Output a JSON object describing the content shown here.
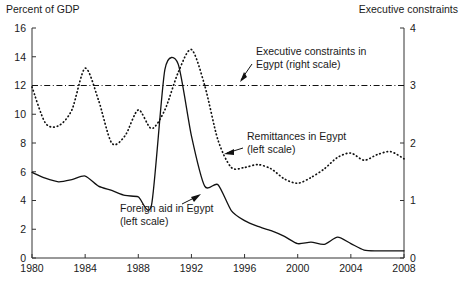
{
  "chart_data": {
    "type": "line",
    "title": "",
    "xlabel": "",
    "ylabel": "Percent of GDP",
    "y2label": "Executive constraints",
    "xlim": [
      1980,
      2008
    ],
    "ylim": [
      0,
      16
    ],
    "y2lim": [
      0,
      4
    ],
    "grid": false,
    "legend_position": "inline-annotations",
    "xticks": [
      "1980",
      "1984",
      "1988",
      "1992",
      "1996",
      "2000",
      "2004",
      "2008"
    ],
    "xtick_values": [
      1980,
      1984,
      1988,
      1992,
      1996,
      2000,
      2004,
      2008
    ],
    "yticks": [
      "0",
      "2",
      "4",
      "6",
      "8",
      "10",
      "12",
      "14",
      "16"
    ],
    "ytick_values": [
      0,
      2,
      4,
      6,
      8,
      10,
      12,
      14,
      16
    ],
    "y2ticks": [
      "0",
      "1",
      "2",
      "3",
      "4"
    ],
    "y2tick_values": [
      0,
      1,
      2,
      3,
      4
    ],
    "x": [
      1980,
      1981,
      1982,
      1983,
      1984,
      1985,
      1986,
      1987,
      1988,
      1989,
      1990,
      1991,
      1992,
      1993,
      1994,
      1995,
      1996,
      1997,
      1998,
      1999,
      2000,
      2001,
      2002,
      2003,
      2004,
      2005,
      2006,
      2007,
      2008
    ],
    "series": [
      {
        "name": "Foreign aid in Egypt",
        "scale": "left",
        "style": "solid",
        "values": [
          5.95,
          5.55,
          5.3,
          5.45,
          5.7,
          5.0,
          4.7,
          4.35,
          4.25,
          3.7,
          13.1,
          13.5,
          8.5,
          5.0,
          5.1,
          3.3,
          2.6,
          2.2,
          1.9,
          1.5,
          1.0,
          1.1,
          0.95,
          1.45,
          1.0,
          0.55,
          0.5,
          0.5,
          0.5
        ]
      },
      {
        "name": "Remittances in Egypt",
        "scale": "left",
        "style": "dotted",
        "values": [
          11.9,
          9.4,
          9.2,
          10.3,
          13.2,
          11.0,
          8.0,
          8.5,
          10.3,
          9.0,
          10.3,
          12.9,
          14.5,
          12.0,
          8.2,
          6.3,
          6.3,
          6.5,
          6.2,
          5.5,
          5.2,
          5.6,
          6.2,
          7.0,
          7.3,
          6.8,
          7.2,
          7.4,
          6.9
        ]
      },
      {
        "name": "Executive constraints in Egypt",
        "scale": "right",
        "style": "dashdot",
        "values": [
          3,
          3,
          3,
          3,
          3,
          3,
          3,
          3,
          3,
          3,
          3,
          3,
          3,
          3,
          3,
          3,
          3,
          3,
          3,
          3,
          3,
          3,
          3,
          3,
          3,
          3,
          3,
          3,
          3
        ]
      }
    ],
    "annotations": [
      {
        "id": "exec-constraints",
        "line1": "Executive constraints in",
        "line2": "Egypt (right scale)"
      },
      {
        "id": "remittances",
        "line1": "Remittances in Egypt",
        "line2": "(left scale)"
      },
      {
        "id": "foreign-aid",
        "line1": "Foreign aid in Egypt",
        "line2": "(left scale)"
      }
    ]
  }
}
